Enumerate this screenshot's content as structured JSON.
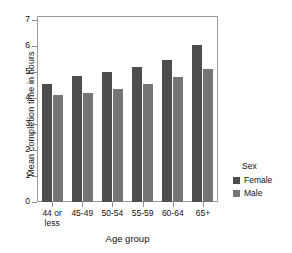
{
  "chart_data": {
    "type": "bar",
    "title": "",
    "xlabel": "Age group",
    "ylabel": "Mean completion time in hours",
    "categories": [
      "44 or less",
      "45-49",
      "50-54",
      "55-59",
      "60-64",
      "65+"
    ],
    "series": [
      {
        "name": "Female",
        "color": "#4d4d4d",
        "values": [
          4.55,
          4.85,
          5.0,
          5.2,
          5.45,
          6.05
        ]
      },
      {
        "name": "Male",
        "color": "#757575",
        "values": [
          4.1,
          4.2,
          4.35,
          4.55,
          4.8,
          5.1
        ]
      }
    ],
    "ylim": [
      0,
      7.3
    ],
    "yticks": [
      0,
      1,
      2,
      3,
      4,
      5,
      6,
      7
    ],
    "ytick_labels": [
      "0",
      "1",
      "2",
      "3",
      "4",
      "5",
      "6",
      "7"
    ],
    "grid": false,
    "legend": {
      "title": "Sex",
      "position": "right",
      "entries": [
        "Female",
        "Male"
      ]
    }
  },
  "axes": {
    "y_title": "Mean completion time in hours",
    "x_title": "Age group"
  },
  "legend": {
    "title": "Sex",
    "items": [
      {
        "label": "Female",
        "color": "#4d4d4d"
      },
      {
        "label": "Male",
        "color": "#757575"
      }
    ]
  },
  "colors": {
    "female": "#4d4d4d",
    "male": "#757575",
    "frame": "#9a9a9a",
    "background": "#ffffff"
  }
}
